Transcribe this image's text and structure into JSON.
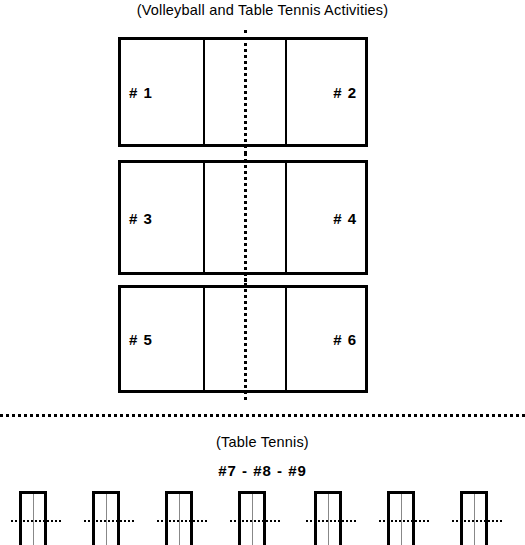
{
  "diagram": {
    "main_title": "(Volleyball and Table Tennis Activities)",
    "table_tennis_title": "(Table Tennis)",
    "table_tennis_court_numbers": "#7 - #8 - #9",
    "colors": {
      "line": "#000000",
      "background": "#ffffff",
      "center_line": "#888888"
    }
  },
  "volleyball_courts": [
    {
      "left_label": "# 1",
      "right_label": "# 2"
    },
    {
      "left_label": "# 3",
      "right_label": "# 4"
    },
    {
      "left_label": "# 5",
      "right_label": "# 6"
    }
  ],
  "table_tennis_tables": [
    {
      "x": 19
    },
    {
      "x": 92
    },
    {
      "x": 165
    },
    {
      "x": 238
    },
    {
      "x": 314
    },
    {
      "x": 387
    },
    {
      "x": 460
    }
  ]
}
